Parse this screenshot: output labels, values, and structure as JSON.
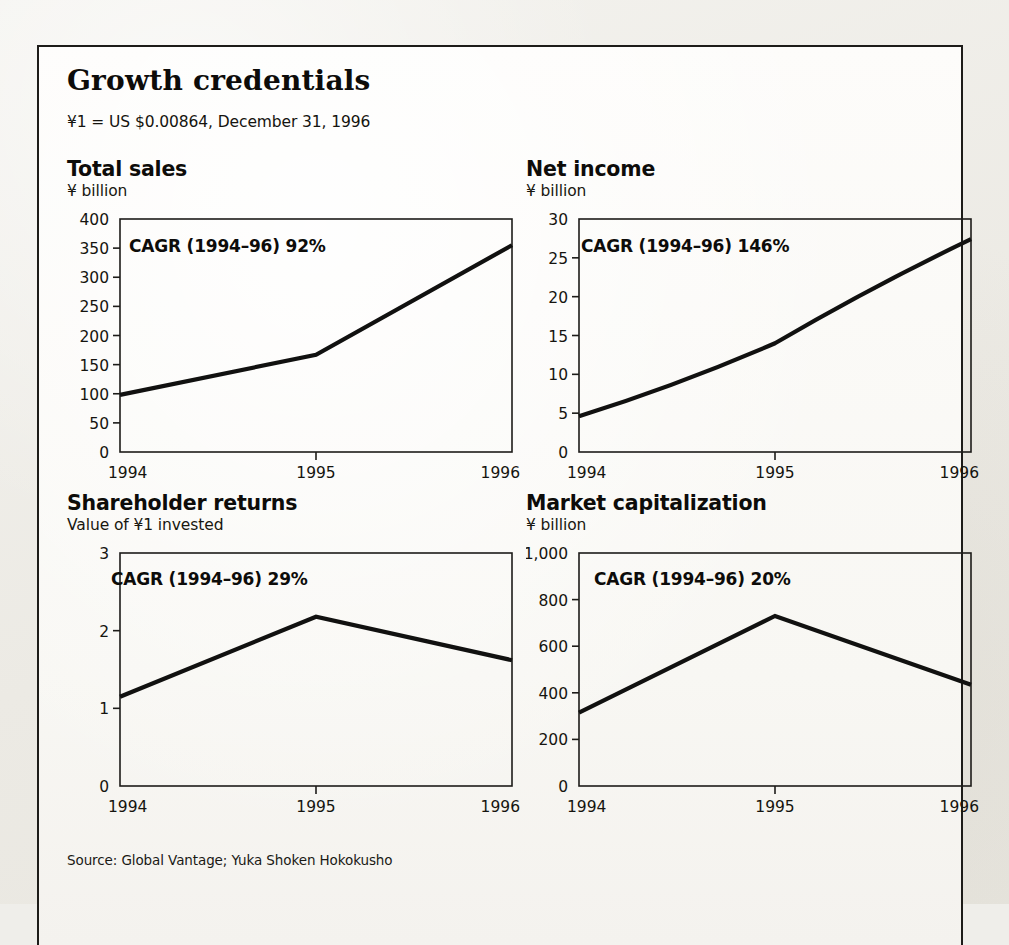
{
  "exhibit": {
    "title": "Growth credentials",
    "fx_note": "¥1 = US $0.00864, December 31, 1996",
    "source": "Source: Global Vantage; Yuka Shoken Hokokusho",
    "line_color": "#111110",
    "axis_color": "#1d1c19",
    "paper_color": "#fbfaf7"
  },
  "chart_data": [
    {
      "id": "total-sales",
      "type": "line",
      "title": "Total sales",
      "ylabel": "¥ billion",
      "xlabel": "",
      "annotation": "CAGR (1994–96) 92%",
      "categories": [
        "1994",
        "1995",
        "1996"
      ],
      "x": [
        1994,
        1995,
        1996
      ],
      "values": [
        98,
        167,
        355
      ],
      "ylim": [
        0,
        400
      ],
      "yticks": [
        0,
        50,
        100,
        150,
        200,
        250,
        300,
        350,
        400
      ],
      "ytick_labels": [
        "0",
        "50",
        "100",
        "150",
        "200",
        "250",
        "300",
        "350",
        "400"
      ],
      "xtick_labels": [
        "1994",
        "1995",
        "1996"
      ],
      "grid": false,
      "legend": "none"
    },
    {
      "id": "net-income",
      "type": "line",
      "title": "Net income",
      "ylabel": "¥ billion",
      "xlabel": "",
      "annotation": "CAGR (1994–96) 146%",
      "categories": [
        "1994",
        "1995",
        "1996"
      ],
      "x": [
        1994,
        1995,
        1996
      ],
      "values": [
        4.6,
        14.0,
        27.4
      ],
      "ylim": [
        0,
        30
      ],
      "yticks": [
        0,
        5,
        10,
        15,
        20,
        25,
        30
      ],
      "ytick_labels": [
        "0",
        "5",
        "10",
        "15",
        "20",
        "25",
        "30"
      ],
      "xtick_labels": [
        "1994",
        "1995",
        "1996"
      ],
      "grid": false,
      "legend": "none"
    },
    {
      "id": "shareholder-returns",
      "type": "line",
      "title": "Shareholder returns",
      "ylabel": "Value of ¥1 invested",
      "xlabel": "",
      "annotation": "CAGR (1994–96) 29%",
      "categories": [
        "1994",
        "1995",
        "1996"
      ],
      "x": [
        1994,
        1995,
        1996
      ],
      "values": [
        1.15,
        2.18,
        1.62
      ],
      "ylim": [
        0,
        3
      ],
      "yticks": [
        0,
        1,
        2,
        3
      ],
      "ytick_labels": [
        "0",
        "1",
        "2",
        "3"
      ],
      "xtick_labels": [
        "1994",
        "1995",
        "1996"
      ],
      "grid": false,
      "legend": "none"
    },
    {
      "id": "market-capitalization",
      "type": "line",
      "title": "Market capitalization",
      "ylabel": "¥ billion",
      "xlabel": "",
      "annotation": "CAGR (1994–96) 20%",
      "categories": [
        "1994",
        "1995",
        "1996"
      ],
      "x": [
        1994,
        1995,
        1996
      ],
      "values": [
        315,
        730,
        435
      ],
      "ylim": [
        0,
        1000
      ],
      "yticks": [
        0,
        200,
        400,
        600,
        800,
        1000
      ],
      "ytick_labels": [
        "0",
        "200",
        "400",
        "600",
        "800",
        "1,000"
      ],
      "xtick_labels": [
        "1994",
        "1995",
        "1996"
      ],
      "grid": false,
      "legend": "none"
    }
  ]
}
